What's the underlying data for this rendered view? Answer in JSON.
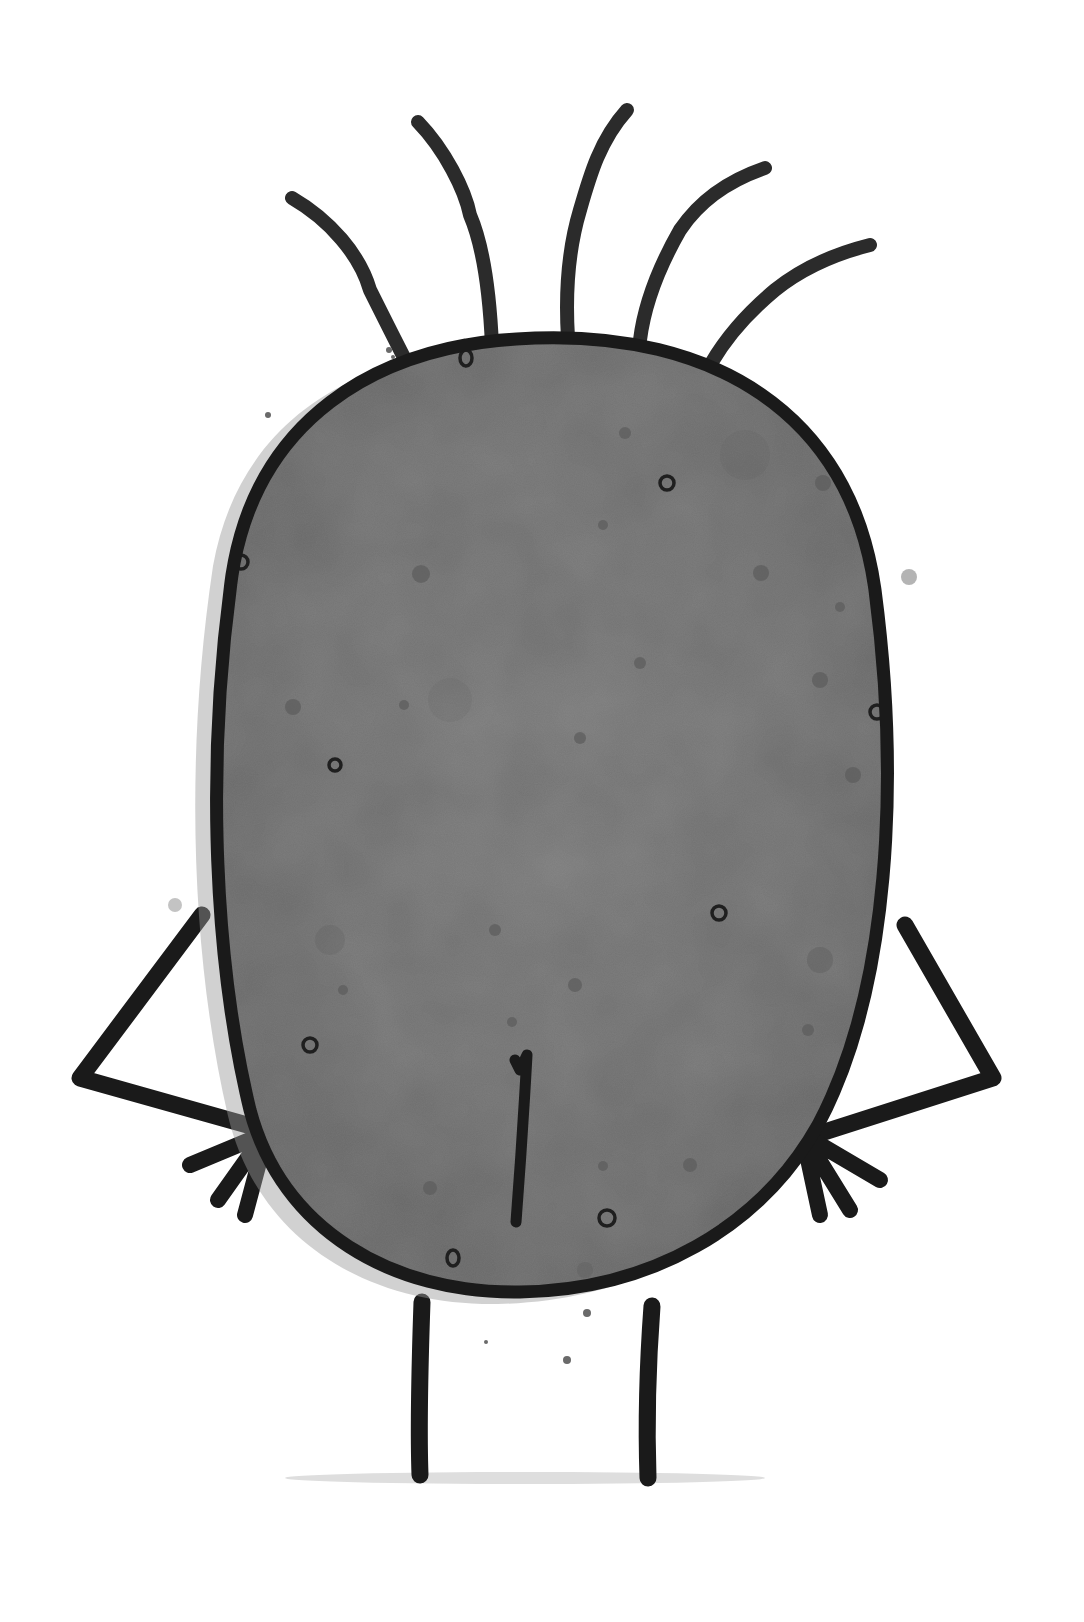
{
  "illustration": {
    "subject": "cartoon potato character viewed from behind",
    "style": "ink and watercolor wash",
    "canvas": {
      "width": 1084,
      "height": 1622,
      "background": "#ffffff"
    },
    "colors": {
      "body_fill": "#7a7a7a",
      "body_fill_light": "#8a8a8a",
      "body_fill_dark": "#6a6a6a",
      "outline": "#1a1a1a",
      "hair": "#2b2b2b",
      "speckle": "#5e5e5e",
      "ground_shadow": "#d4d4d4"
    },
    "parts": {
      "hair_strands": 5,
      "arms": 2,
      "hands_on_hips": true,
      "legs": 2,
      "butt_crease": true,
      "ground_shadow": true
    }
  }
}
